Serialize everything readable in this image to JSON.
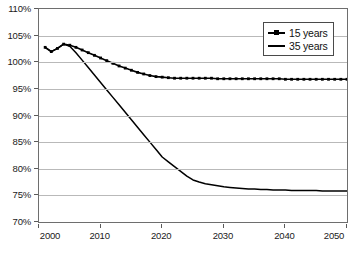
{
  "chart_data": {
    "type": "line",
    "title": "",
    "subtitle": "",
    "xlabel": "",
    "ylabel": "",
    "xlim": [
      2000,
      2050
    ],
    "ylim": [
      70,
      110
    ],
    "y_tick_labels": [
      "110%",
      "105%",
      "100%",
      "95%",
      "90%",
      "85%",
      "80%",
      "75%",
      "70%"
    ],
    "y_tick_values": [
      110,
      105,
      100,
      95,
      90,
      85,
      80,
      75,
      70
    ],
    "x_tick_labels": [
      "2000",
      "2010",
      "2020",
      "2030",
      "2040",
      "2050"
    ],
    "x_tick_values": [
      2000,
      2010,
      2020,
      2030,
      2040,
      2050
    ],
    "grid": "horizontal",
    "legend_position": "top-right",
    "value_unit": "percent",
    "x": [
      2001,
      2002,
      2003,
      2004,
      2005,
      2006,
      2007,
      2008,
      2009,
      2010,
      2011,
      2012,
      2013,
      2014,
      2015,
      2016,
      2017,
      2018,
      2019,
      2020,
      2021,
      2022,
      2023,
      2024,
      2025,
      2026,
      2027,
      2028,
      2029,
      2030,
      2031,
      2032,
      2033,
      2034,
      2035,
      2036,
      2037,
      2038,
      2039,
      2040,
      2041,
      2042,
      2043,
      2044,
      2045,
      2046,
      2047,
      2048,
      2049,
      2050
    ],
    "series": [
      {
        "name": "15 years",
        "marker": "square",
        "color": "#000000",
        "values": [
          102.8,
          102.0,
          102.6,
          103.4,
          103.2,
          102.8,
          102.3,
          101.8,
          101.3,
          100.8,
          100.3,
          99.8,
          99.3,
          98.9,
          98.5,
          98.1,
          97.8,
          97.5,
          97.3,
          97.2,
          97.1,
          97.0,
          97.0,
          97.0,
          97.0,
          97.0,
          97.0,
          97.0,
          96.9,
          96.9,
          96.9,
          96.9,
          96.9,
          96.9,
          96.9,
          96.9,
          96.9,
          96.9,
          96.9,
          96.8,
          96.8,
          96.8,
          96.8,
          96.8,
          96.8,
          96.8,
          96.8,
          96.8,
          96.8,
          96.8
        ]
      },
      {
        "name": "35 years",
        "marker": "none",
        "color": "#000000",
        "values": [
          102.8,
          102.0,
          102.6,
          103.4,
          103.0,
          101.8,
          100.4,
          99.0,
          97.6,
          96.2,
          94.8,
          93.4,
          92.0,
          90.6,
          89.2,
          87.8,
          86.4,
          85.0,
          83.6,
          82.2,
          81.3,
          80.4,
          79.5,
          78.6,
          77.9,
          77.5,
          77.2,
          77.0,
          76.8,
          76.6,
          76.5,
          76.4,
          76.3,
          76.2,
          76.2,
          76.1,
          76.1,
          76.0,
          76.0,
          76.0,
          75.9,
          75.9,
          75.9,
          75.9,
          75.9,
          75.8,
          75.8,
          75.8,
          75.8,
          75.8
        ]
      }
    ]
  },
  "legend": {
    "entries": [
      {
        "label": "15 years"
      },
      {
        "label": "35 years"
      }
    ]
  },
  "caption": {
    "text": ""
  }
}
